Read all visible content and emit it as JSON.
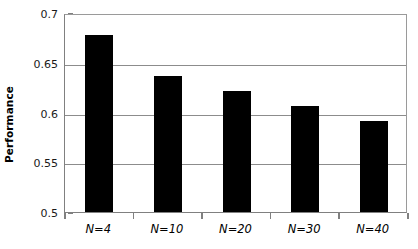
{
  "chart_data": {
    "type": "bar",
    "title": "",
    "subtitle": "",
    "xlabel": "",
    "ylabel": "Performance",
    "categories": [
      "N=4",
      "N=10",
      "N=20",
      "N=30",
      "N=40"
    ],
    "values": [
      0.678,
      0.637,
      0.622,
      0.607,
      0.591
    ],
    "series": [
      {
        "name": "Performance",
        "values": [
          0.678,
          0.637,
          0.622,
          0.607,
          0.591
        ]
      }
    ],
    "ylim": [
      0.5,
      0.7
    ],
    "ytick_labels": [
      "0.5",
      "0.55",
      "0.6",
      "0.65",
      "0.7"
    ],
    "ytick_values": [
      0.5,
      0.55,
      0.6,
      0.65,
      0.7
    ],
    "grid": true,
    "grid_axis": "y",
    "legend": false,
    "legend_position": "none",
    "bar_color": "#000000",
    "grid_color": "#8c8c8c",
    "axis_color": "#808080",
    "background_color": "#ffffff",
    "annotations": []
  },
  "axis": {
    "y_title": "Performance"
  }
}
